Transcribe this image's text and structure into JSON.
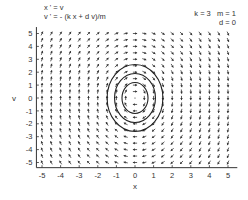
{
  "chart_data": {
    "type": "vector_field_phase_plane",
    "title": "",
    "equations": [
      "x ' = v",
      "v ' = - (k x + d v)/m"
    ],
    "parameters": {
      "k": 3,
      "m": 1,
      "d": 0
    },
    "parameter_labels": [
      "k = 3   m = 1",
      "d = 0"
    ],
    "xlabel": "x",
    "ylabel": "v",
    "xlim": [
      -5.3,
      5.5
    ],
    "ylim": [
      -5.4,
      5.5
    ],
    "xticks": [
      -5,
      -4,
      -3,
      -2,
      -1,
      0,
      1,
      2,
      3,
      4,
      5
    ],
    "yticks": [
      -5,
      -4,
      -3,
      -2,
      -1,
      0,
      1,
      2,
      3,
      4,
      5
    ],
    "xtick_labels": [
      "-5",
      "-4",
      "-3",
      "-2",
      "-1",
      "0",
      "1",
      "2",
      "3",
      "4",
      "5"
    ],
    "ytick_labels": [
      "-5",
      "-4",
      "-3",
      "-2",
      "-1",
      "0",
      "1",
      "2",
      "3",
      "4",
      "5"
    ],
    "field_grid": {
      "x_from": -5,
      "x_to": 5,
      "y_from": -5,
      "y_to": 5,
      "step": 0.5
    },
    "trajectories": [
      {
        "name": "outer-orbit",
        "x_amplitude": 1.5,
        "v_amplitude": 2.6
      },
      {
        "name": "middle-orbit",
        "x_amplitude": 1.1,
        "v_amplitude": 1.9
      },
      {
        "name": "inner-orbit",
        "x_amplitude": 0.7,
        "v_amplitude": 1.2
      }
    ],
    "grid": false,
    "colors": {
      "arrows": "#333333",
      "orbits": "#222222",
      "axes": "#333333"
    }
  }
}
